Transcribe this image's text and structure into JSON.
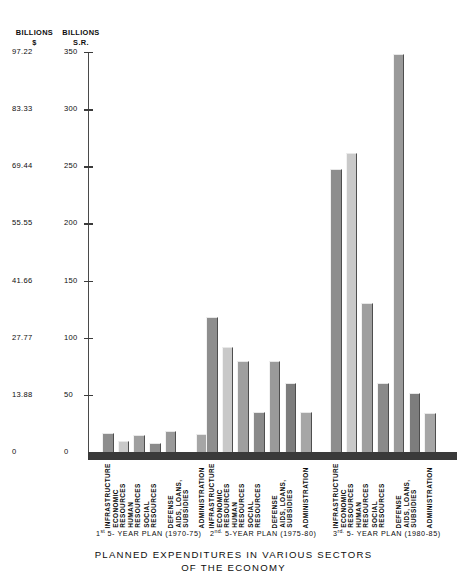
{
  "axis": {
    "header_left_main": "BILLIONS",
    "header_left_sub": "$",
    "header_right_main": "BILLIONS",
    "header_right_sub": "S.R.",
    "ticks": [
      {
        "dollars": "97.22",
        "sr": "350",
        "value": 350
      },
      {
        "dollars": "83.33",
        "sr": "300",
        "value": 300
      },
      {
        "dollars": "69.44",
        "sr": "250",
        "value": 250
      },
      {
        "dollars": "55.55",
        "sr": "200",
        "value": 200
      },
      {
        "dollars": "41.66",
        "sr": "150",
        "value": 150
      },
      {
        "dollars": "27.77",
        "sr": "100",
        "value": 100
      },
      {
        "dollars": "13.88",
        "sr": "50",
        "value": 50
      },
      {
        "dollars": "0",
        "sr": "0",
        "value": 0
      }
    ]
  },
  "title": {
    "line1": "PLANNED EXPENDITURES IN VARIOUS SECTORS",
    "line2": "OF THE ECONOMY"
  },
  "plans": [
    {
      "ordinal": "1",
      "suffix": "st",
      "caption_rest": "5- YEAR PLAN (1970-75)"
    },
    {
      "ordinal": "2",
      "suffix": "nd.",
      "caption_rest": "5-YEAR PLAN (1975-80)"
    },
    {
      "ordinal": "3",
      "suffix": "rd.",
      "caption_rest": "5- YEAR PLAN (1980-85)"
    }
  ],
  "categories_display": [
    [
      "INFRASTRUCTURE"
    ],
    [
      "ECONOMIC",
      "RESOURCES"
    ],
    [
      "HUMAN",
      "RESOURCES"
    ],
    [
      "SOCIAL",
      "RESOURCES"
    ],
    [
      "DEFENSE"
    ],
    [
      "AIDS, LOANS,",
      "SUBSIDIES"
    ],
    [
      "ADMINISTRATION"
    ]
  ],
  "chart_data": {
    "type": "bar",
    "title": "PLANNED EXPENDITURES IN VARIOUS SECTORS OF THE ECONOMY",
    "xlabel": "",
    "ylabel": "BILLIONS S.R.",
    "ylabel_secondary": "BILLIONS $",
    "ylim": [
      0,
      350
    ],
    "yticks": [
      0,
      50,
      100,
      150,
      200,
      250,
      300,
      350
    ],
    "ytick_labels_sr": [
      "0",
      "50",
      "100",
      "150",
      "200",
      "250",
      "300",
      "350"
    ],
    "ytick_labels_dollars": [
      "0",
      "13.88",
      "27.77",
      "41.66",
      "55.55",
      "69.44",
      "83.33",
      "97.22"
    ],
    "grid": false,
    "legend": "none",
    "categories": [
      "INFRASTRUCTURE",
      "ECONOMIC RESOURCES",
      "HUMAN RESOURCES",
      "SOCIAL RESOURCES",
      "DEFENSE",
      "AIDS, LOANS, SUBSIDIES",
      "ADMINISTRATION"
    ],
    "series": [
      {
        "name": "1st 5-YEAR PLAN (1970-75)",
        "values": [
          17,
          10,
          15,
          8,
          18,
          0,
          16
        ]
      },
      {
        "name": "2nd 5-YEAR PLAN (1975-80)",
        "values": [
          118,
          92,
          80,
          35,
          80,
          60,
          35
        ]
      },
      {
        "name": "3rd 5-YEAR PLAN (1980-85)",
        "values": [
          248,
          262,
          130,
          60,
          348,
          52,
          34
        ]
      }
    ],
    "bar_fill_colors": [
      "#8e8e8e",
      "#c9c9c9",
      "#9f9f9f",
      "#8a8a8a",
      "#9a9a9a",
      "#7d7d7d",
      "#a6a6a6"
    ]
  }
}
